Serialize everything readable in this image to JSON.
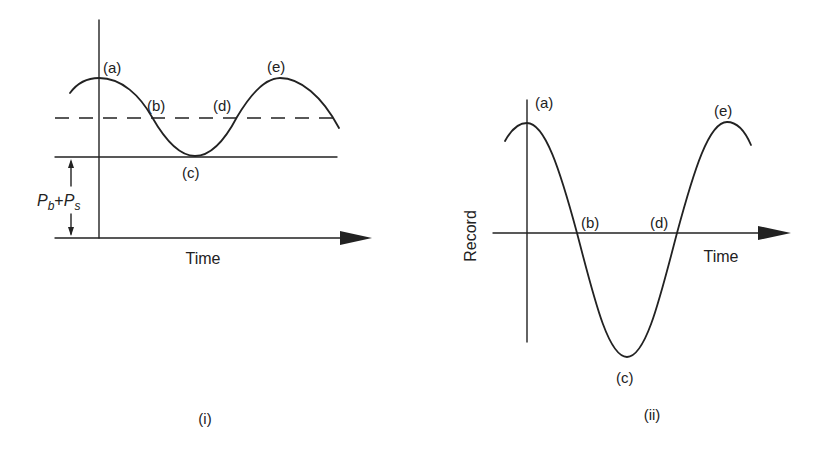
{
  "figure": {
    "panels": [
      {
        "id": "i",
        "caption": "(i)",
        "x_axis_label": "Time",
        "dimension_label": {
          "p1": "P",
          "sub1": "b",
          "plus": "+",
          "p2": "P",
          "sub2": "s"
        },
        "points": {
          "a": "(a)",
          "b": "(b)",
          "c": "(c)",
          "d": "(d)",
          "e": "(e)"
        },
        "description": "Absolute pressure vs time: sinusoid oscillating about a dashed mean line above a solid baseline at P_b+P_s"
      },
      {
        "id": "ii",
        "caption": "(ii)",
        "x_axis_label": "Time",
        "y_axis_label": "Record",
        "points": {
          "a": "(a)",
          "b": "(b)",
          "c": "(c)",
          "d": "(d)",
          "e": "(e)"
        },
        "description": "Recorded signal vs time: sinusoid crossing the time axis at (b) and (d)"
      }
    ],
    "colors": {
      "ink": "#222222",
      "background": "#ffffff"
    }
  }
}
